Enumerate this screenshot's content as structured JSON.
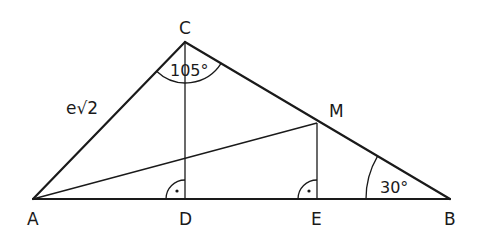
{
  "diagram": {
    "type": "geometry-triangle",
    "points": {
      "A": {
        "label": "A",
        "x": 33,
        "y": 199
      },
      "B": {
        "label": "B",
        "x": 450,
        "y": 199
      },
      "C": {
        "label": "C",
        "x": 185,
        "y": 42
      },
      "D": {
        "label": "D",
        "x": 185,
        "y": 199
      },
      "E": {
        "label": "E",
        "x": 317,
        "y": 199
      },
      "M": {
        "label": "M",
        "x": 317,
        "y": 123
      }
    },
    "side_label_AC": "e√2",
    "angle_C": "105°",
    "angle_B": "30°",
    "right_angle_D_mark": "·",
    "right_angle_E_mark": "·",
    "stroke_color": "#1a1a1a"
  }
}
